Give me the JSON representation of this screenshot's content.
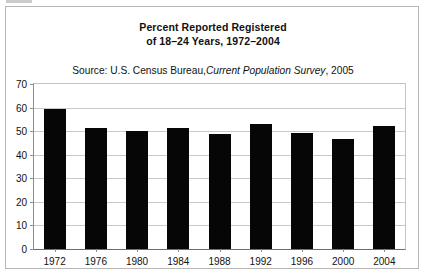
{
  "figure": {
    "title_line1": "Percent Reported Registered",
    "title_line2": "of 18–24 Years, 1972–2004",
    "source_prefix": "Source: U.S. Census Bureau,",
    "source_italic": "Current Population Survey",
    "source_suffix": ", 2005"
  },
  "chart_data": {
    "type": "bar",
    "title": "Percent Reported Registered of 18–24 Years, 1972–2004",
    "subtitle": "Source: U.S. Census Bureau, Current Population Survey, 2005",
    "xlabel": "",
    "ylabel": "",
    "categories": [
      "1972",
      "1976",
      "1980",
      "1984",
      "1988",
      "1992",
      "1996",
      "2000",
      "2004"
    ],
    "values": [
      59.5,
      51.5,
      50.0,
      51.5,
      48.7,
      53.0,
      49.3,
      46.7,
      52.0
    ],
    "ylim": [
      0,
      70
    ],
    "yticks": [
      "0",
      "10",
      "20",
      "30",
      "40",
      "50",
      "60",
      "70"
    ],
    "grid": true,
    "legend": "none",
    "bar_color": "#060606"
  }
}
